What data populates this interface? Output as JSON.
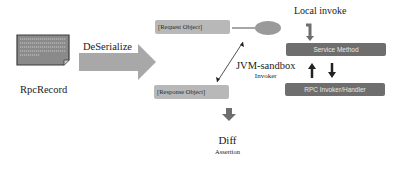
{
  "diagram": {
    "source": {
      "icon": "document-icon",
      "label": "RpcRecord"
    },
    "deserialize_arrow": {
      "label": "DeSerialize"
    },
    "request_object": {
      "label": "[Request Object]"
    },
    "response_object": {
      "label": "[Response Object]"
    },
    "sandbox": {
      "label": "JVM-sandbox",
      "sublabel": "Invoker"
    },
    "local_invoke": {
      "label": "Local invoke"
    },
    "service_method": {
      "label": "Service Method"
    },
    "rpc_handler": {
      "label": "RPC Invoker/Handler"
    },
    "diff": {
      "label": "Diff",
      "sublabel": "Assertion"
    },
    "colors": {
      "box_dark": "#6e6e6e",
      "box_light": "#b8b8b8",
      "arrow_gray": "#8c8c8c",
      "ellipse": "#9a9a9a",
      "text": "#1a1a1a"
    }
  }
}
